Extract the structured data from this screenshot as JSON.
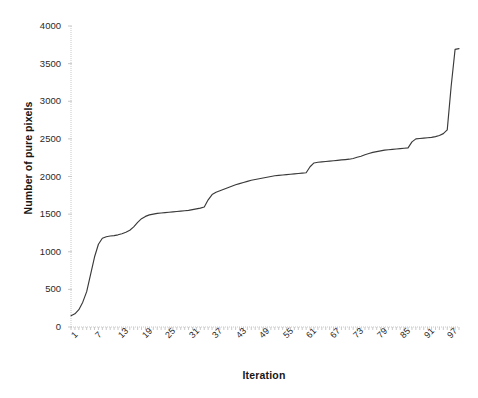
{
  "chart_data": {
    "type": "line",
    "title": "",
    "xlabel": "Iteration",
    "ylabel": "Number of pure pixels",
    "xlim": [
      1,
      100
    ],
    "ylim": [
      0,
      4000
    ],
    "grid": false,
    "legend": null,
    "line_color": "#3a3a3a",
    "y_ticks": [
      0,
      500,
      1000,
      1500,
      2000,
      2500,
      3000,
      3500,
      4000
    ],
    "y_tick_labels": [
      "0",
      "500",
      "1000",
      "1500",
      "2000",
      "2500",
      "3000",
      "3500",
      "4000"
    ],
    "x_ticks": [
      1,
      7,
      13,
      19,
      25,
      31,
      37,
      43,
      49,
      55,
      61,
      67,
      73,
      79,
      85,
      91,
      97
    ],
    "x_tick_labels": [
      "1",
      "7",
      "13",
      "19",
      "25",
      "31",
      "37",
      "43",
      "49",
      "55",
      "61",
      "67",
      "73",
      "79",
      "85",
      "91",
      "97"
    ],
    "x": [
      1,
      2,
      3,
      4,
      5,
      6,
      7,
      8,
      9,
      10,
      11,
      12,
      13,
      14,
      15,
      16,
      17,
      18,
      19,
      20,
      21,
      22,
      23,
      24,
      25,
      26,
      27,
      28,
      29,
      30,
      31,
      32,
      33,
      34,
      35,
      36,
      37,
      38,
      39,
      40,
      41,
      42,
      43,
      44,
      45,
      46,
      47,
      48,
      49,
      50,
      51,
      52,
      53,
      54,
      55,
      56,
      57,
      58,
      59,
      60,
      61,
      62,
      63,
      64,
      65,
      66,
      67,
      68,
      69,
      70,
      71,
      72,
      73,
      74,
      75,
      76,
      77,
      78,
      79,
      80,
      81,
      82,
      83,
      84,
      85,
      86,
      87,
      88,
      89,
      90,
      91,
      92,
      93,
      94,
      95,
      96,
      97,
      98,
      99,
      100
    ],
    "y": [
      150,
      175,
      230,
      330,
      470,
      700,
      930,
      1100,
      1180,
      1200,
      1210,
      1215,
      1225,
      1240,
      1260,
      1285,
      1330,
      1390,
      1440,
      1470,
      1490,
      1500,
      1510,
      1515,
      1520,
      1525,
      1530,
      1535,
      1540,
      1545,
      1550,
      1560,
      1570,
      1580,
      1595,
      1690,
      1760,
      1790,
      1810,
      1830,
      1850,
      1870,
      1890,
      1905,
      1920,
      1935,
      1950,
      1960,
      1970,
      1980,
      1990,
      2000,
      2010,
      2015,
      2020,
      2025,
      2030,
      2035,
      2040,
      2045,
      2050,
      2130,
      2180,
      2190,
      2195,
      2200,
      2205,
      2210,
      2215,
      2220,
      2225,
      2230,
      2240,
      2255,
      2270,
      2290,
      2305,
      2320,
      2330,
      2340,
      2350,
      2355,
      2360,
      2365,
      2370,
      2375,
      2380,
      2460,
      2500,
      2505,
      2510,
      2515,
      2520,
      2530,
      2545,
      2570,
      2620,
      3200,
      3690,
      3700
    ],
    "series_name": "Number of pure pixels",
    "axis_color": "#c9c9c9"
  }
}
